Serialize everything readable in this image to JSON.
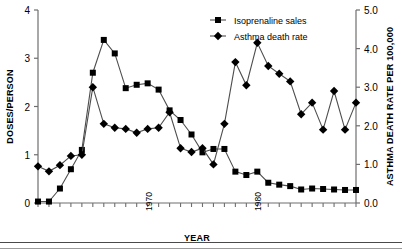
{
  "chart_data": {
    "type": "line",
    "title": "",
    "xlabel": "YEAR",
    "ylabel": "DOSES/PERSON",
    "y2label": "ASTHMA DEATH RATE PER 100,000",
    "xlim": [
      1960,
      1989
    ],
    "ylim": [
      0,
      4
    ],
    "y2lim": [
      0.0,
      5.0
    ],
    "grid": false,
    "legend_position": "top-center-right",
    "x_tick_labels": [
      "1970",
      "1980"
    ],
    "x_tick_label_values": [
      1970,
      1980
    ],
    "x_tick_label_rotation": -90,
    "y_tick_labels": [
      "0",
      "1",
      "2",
      "3",
      "4"
    ],
    "y_tick_values": [
      0,
      1,
      2,
      3,
      4
    ],
    "y2_tick_labels": [
      "0.0",
      "1.0",
      "2.0",
      "3.0",
      "4.0",
      "5.0"
    ],
    "y2_tick_values": [
      0.0,
      1.0,
      2.0,
      3.0,
      4.0,
      5.0
    ],
    "x": [
      1960,
      1961,
      1962,
      1963,
      1964,
      1965,
      1966,
      1967,
      1968,
      1969,
      1970,
      1971,
      1972,
      1973,
      1974,
      1975,
      1976,
      1977,
      1978,
      1979,
      1980,
      1981,
      1982,
      1983,
      1984,
      1985,
      1986,
      1987,
      1988,
      1989
    ],
    "series": [
      {
        "name": "Isoprenaline sales",
        "marker": "square",
        "axis": "left",
        "unit": "doses/person",
        "values": [
          0.03,
          0.03,
          0.3,
          0.7,
          1.1,
          2.7,
          3.38,
          3.1,
          2.38,
          2.45,
          2.48,
          2.35,
          1.92,
          1.72,
          1.42,
          1.05,
          1.12,
          1.12,
          0.65,
          0.58,
          0.65,
          0.42,
          0.38,
          0.35,
          0.28,
          0.3,
          0.29,
          0.28,
          0.27,
          0.27
        ]
      },
      {
        "name": "Asthma death rate",
        "marker": "diamond",
        "axis": "right",
        "unit": "deaths per 100,000",
        "values": [
          0.95,
          0.82,
          0.98,
          1.22,
          1.25,
          3.0,
          2.05,
          1.95,
          1.92,
          1.82,
          1.92,
          1.95,
          2.35,
          1.42,
          1.32,
          1.42,
          1.0,
          2.05,
          3.65,
          3.05,
          4.15,
          3.55,
          3.35,
          3.15,
          2.3,
          2.6,
          1.9,
          2.9,
          1.9,
          2.6
        ]
      }
    ]
  },
  "legend": {
    "items": [
      {
        "label": "Isoprenaline sales",
        "marker": "square"
      },
      {
        "label": "Asthma death rate",
        "marker": "diamond"
      }
    ]
  },
  "axes": {
    "left_title": "DOSES/PERSON",
    "right_title": "ASTHMA DEATH RATE PER 100,000",
    "bottom_title": "YEAR"
  },
  "colors": {
    "ink": "#000000",
    "axis": "#6e6e6e",
    "line": "#4d4d4d",
    "rule": "#5a5a5a"
  }
}
